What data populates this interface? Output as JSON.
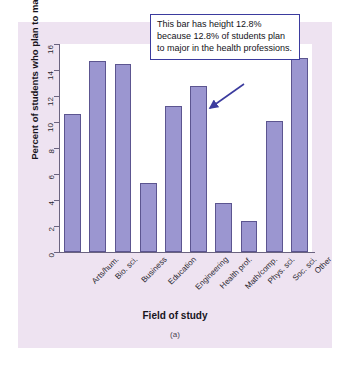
{
  "figure": {
    "panel_caption": "(a)",
    "x_axis_title": "Field of study",
    "y_axis_title": "Percent of students who plan to major",
    "annotation": "This bar has height 12.8% because 12.8% of students plan to major in the health professions.",
    "colors": {
      "bar_fill": "#9b96d0",
      "bar_edge": "#5c5590",
      "panel_background": "#eee3f1",
      "plot_background": "#ffffff",
      "axis": "#6b6480",
      "callout_border": "#3b3b9e"
    }
  },
  "chart_data": {
    "type": "bar",
    "title": "",
    "xlabel": "Field of study",
    "ylabel": "Percent of students who plan to major",
    "categories": [
      "Arts/hum.",
      "Bio. sci.",
      "Business",
      "Education",
      "Engineering",
      "Health prof.",
      "Math/comp.",
      "Phys. sci.",
      "Soc. sci.",
      "Other"
    ],
    "values": [
      10.6,
      14.7,
      14.5,
      5.3,
      11.2,
      12.8,
      3.75,
      2.4,
      10.1,
      14.9
    ],
    "ylim": [
      0,
      16
    ],
    "yticks": [
      0,
      2,
      4,
      6,
      8,
      10,
      12,
      14,
      16
    ],
    "ytick_labels": [
      "0",
      "2",
      "4",
      "6",
      "8",
      "10",
      "12",
      "14",
      "16"
    ],
    "grid": false,
    "legend": null,
    "annotations": [
      {
        "text": "This bar has height 12.8% because 12.8% of students plan to major in the health professions.",
        "points_to": "Health prof.",
        "value": 12.8
      }
    ]
  }
}
